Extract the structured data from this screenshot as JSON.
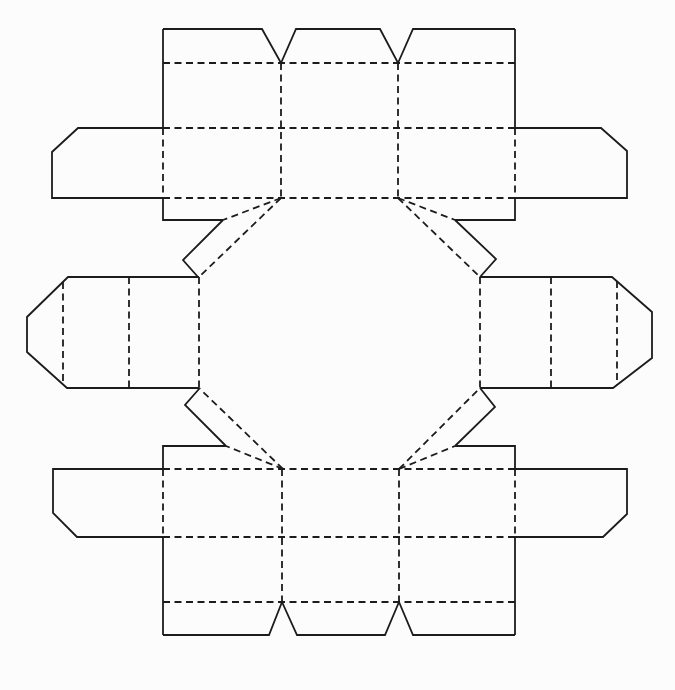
{
  "figure": {
    "kind": "packaging-die-cut-net",
    "background_color": "#fcfcfc",
    "line_color": "#1c1c1c",
    "canvas": {
      "width": 675,
      "height": 690
    },
    "stroke_width": 1.8,
    "fold_dash_pattern": "7 4.5",
    "cut_lines": [
      [
        [
          163,
          29
        ],
        [
          262,
          29
        ],
        [
          281,
          63
        ],
        [
          296,
          29
        ],
        [
          380,
          29
        ],
        [
          398,
          63
        ],
        [
          413,
          29
        ],
        [
          515,
          29
        ]
      ],
      [
        [
          163,
          29
        ],
        [
          163,
          128
        ]
      ],
      [
        [
          163,
          198
        ],
        [
          163,
          220
        ],
        [
          223,
          220
        ]
      ],
      [
        [
          515,
          29
        ],
        [
          515,
          128
        ]
      ],
      [
        [
          515,
          198
        ],
        [
          515,
          220
        ],
        [
          455,
          220
        ]
      ],
      [
        [
          163,
          128
        ],
        [
          78,
          128
        ],
        [
          52,
          152
        ],
        [
          52,
          198
        ],
        [
          163,
          198
        ]
      ],
      [
        [
          515,
          128
        ],
        [
          601,
          128
        ],
        [
          627,
          151
        ],
        [
          627,
          198
        ],
        [
          515,
          198
        ]
      ],
      [
        [
          223,
          220
        ],
        [
          183,
          260
        ],
        [
          198,
          277
        ]
      ],
      [
        [
          455,
          220
        ],
        [
          496,
          259
        ],
        [
          480,
          277
        ]
      ],
      [
        [
          226,
          446
        ],
        [
          185,
          405
        ],
        [
          199,
          389
        ]
      ],
      [
        [
          455,
          446
        ],
        [
          495,
          407
        ],
        [
          480,
          388
        ]
      ],
      [
        [
          199,
          277
        ],
        [
          68,
          277
        ],
        [
          27,
          317
        ],
        [
          27,
          352
        ],
        [
          67,
          388
        ],
        [
          199,
          388
        ]
      ],
      [
        [
          480,
          277
        ],
        [
          612,
          277
        ],
        [
          652,
          312
        ],
        [
          652,
          358
        ],
        [
          613,
          388
        ],
        [
          480,
          388
        ]
      ],
      [
        [
          163,
          635
        ],
        [
          269,
          635
        ],
        [
          282,
          602
        ],
        [
          297,
          635
        ],
        [
          385,
          635
        ],
        [
          399,
          602
        ],
        [
          413,
          635
        ],
        [
          515,
          635
        ]
      ],
      [
        [
          163,
          537
        ],
        [
          163,
          635
        ]
      ],
      [
        [
          226,
          446
        ],
        [
          163,
          446
        ],
        [
          163,
          469
        ]
      ],
      [
        [
          515,
          537
        ],
        [
          515,
          635
        ]
      ],
      [
        [
          455,
          446
        ],
        [
          515,
          446
        ],
        [
          515,
          469
        ]
      ],
      [
        [
          163,
          469
        ],
        [
          53,
          469
        ],
        [
          53,
          513
        ],
        [
          77,
          537
        ],
        [
          163,
          537
        ]
      ],
      [
        [
          515,
          469
        ],
        [
          627,
          469
        ],
        [
          627,
          514
        ],
        [
          603,
          537
        ],
        [
          515,
          537
        ]
      ]
    ],
    "fold_lines": [
      [
        [
          163,
          63
        ],
        [
          515,
          63
        ]
      ],
      [
        [
          163,
          128
        ],
        [
          515,
          128
        ]
      ],
      [
        [
          163,
          198
        ],
        [
          515,
          198
        ]
      ],
      [
        [
          281,
          63
        ],
        [
          281,
          198
        ]
      ],
      [
        [
          398,
          63
        ],
        [
          398,
          198
        ]
      ],
      [
        [
          163,
          128
        ],
        [
          163,
          198
        ]
      ],
      [
        [
          515,
          128
        ],
        [
          515,
          198
        ]
      ],
      [
        [
          199,
          277
        ],
        [
          199,
          388
        ]
      ],
      [
        [
          480,
          277
        ],
        [
          480,
          388
        ]
      ],
      [
        [
          281,
          198
        ],
        [
          199,
          277
        ]
      ],
      [
        [
          398,
          198
        ],
        [
          480,
          277
        ]
      ],
      [
        [
          283,
          469
        ],
        [
          199,
          388
        ]
      ],
      [
        [
          399,
          469
        ],
        [
          480,
          388
        ]
      ],
      [
        [
          281,
          198
        ],
        [
          223,
          220
        ]
      ],
      [
        [
          398,
          198
        ],
        [
          455,
          220
        ]
      ],
      [
        [
          283,
          469
        ],
        [
          226,
          446
        ]
      ],
      [
        [
          399,
          469
        ],
        [
          455,
          446
        ]
      ],
      [
        [
          63,
          282
        ],
        [
          63,
          384
        ]
      ],
      [
        [
          129,
          277
        ],
        [
          129,
          388
        ]
      ],
      [
        [
          551,
          277
        ],
        [
          551,
          388
        ]
      ],
      [
        [
          617,
          281
        ],
        [
          617,
          385
        ]
      ],
      [
        [
          163,
          469
        ],
        [
          515,
          469
        ]
      ],
      [
        [
          163,
          537
        ],
        [
          515,
          537
        ]
      ],
      [
        [
          163,
          602
        ],
        [
          515,
          602
        ]
      ],
      [
        [
          282,
          469
        ],
        [
          282,
          602
        ]
      ],
      [
        [
          399,
          469
        ],
        [
          399,
          602
        ]
      ],
      [
        [
          163,
          469
        ],
        [
          163,
          537
        ]
      ],
      [
        [
          515,
          469
        ],
        [
          515,
          537
        ]
      ]
    ]
  }
}
